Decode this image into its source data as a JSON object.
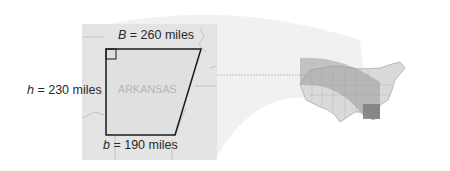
{
  "figure": {
    "state_name": "ARKANSAS",
    "labels": {
      "top": {
        "var": "B",
        "eq": " = 260 miles"
      },
      "left": {
        "var": "h",
        "eq": " = 230 miles"
      },
      "bottom": {
        "var": "b",
        "eq": " = 190 miles"
      }
    },
    "measurements": {
      "B_miles": 260,
      "h_miles": 230,
      "b_miles": 190
    },
    "shape": "trapezoid",
    "right_angle_marker": true,
    "inset": "United States map with Arkansas highlighted"
  },
  "colors": {
    "outline": "#1a1a1a",
    "map_bg": "#e6e6e6",
    "shape_fill": "#dcdcdc",
    "beam": "#efefef",
    "highlight": "#8c8c8c"
  }
}
